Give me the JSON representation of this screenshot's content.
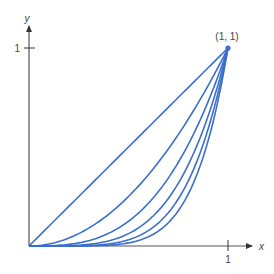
{
  "chart_data": {
    "type": "line",
    "title": "",
    "xlabel": "x",
    "ylabel": "y",
    "xlim": [
      0,
      1
    ],
    "ylim": [
      0,
      1
    ],
    "x_ticks": [
      "1"
    ],
    "y_ticks": [
      "1"
    ],
    "grid": false,
    "legend": null,
    "annotations": [
      {
        "text": "(1, 1)",
        "x": 1,
        "y": 1
      }
    ],
    "series": [
      {
        "name": "y = x",
        "exponent": 1
      },
      {
        "name": "y = x^2",
        "exponent": 2
      },
      {
        "name": "y = x^3",
        "exponent": 3
      },
      {
        "name": "y = x^4",
        "exponent": 4
      },
      {
        "name": "y = x^5",
        "exponent": 5
      },
      {
        "name": "y = x^6",
        "exponent": 6
      }
    ],
    "color": "#3a6fce"
  },
  "labels": {
    "x_axis": "x",
    "y_axis": "y",
    "x_tick_1": "1",
    "y_tick_1": "1",
    "point": "(1, 1)"
  }
}
